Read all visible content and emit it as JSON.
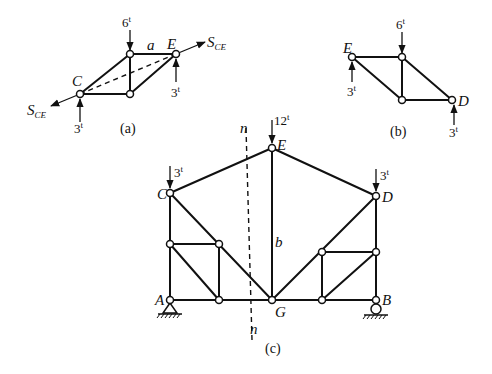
{
  "figure_a": {
    "caption": "(a)",
    "node_labels": {
      "C": "C",
      "E": "E"
    },
    "member_label": "a",
    "loads": {
      "top": "6",
      "C": "3",
      "E": "3"
    },
    "load_unit": "t",
    "force_label": "S",
    "force_subscript": "CE"
  },
  "figure_b": {
    "caption": "(b)",
    "node_labels": {
      "E": "E",
      "D": "D"
    },
    "loads": {
      "top": "6",
      "E": "3",
      "D": "3"
    },
    "load_unit": "t"
  },
  "figure_c": {
    "caption": "(c)",
    "node_labels": {
      "A": "A",
      "B": "B",
      "C": "C",
      "D": "D",
      "E": "E",
      "G": "G"
    },
    "member_label": "b",
    "section_label_top": "n",
    "section_label_bottom": "n",
    "loads": {
      "E": "12",
      "C": "3",
      "D": "3"
    },
    "load_unit": "t"
  }
}
